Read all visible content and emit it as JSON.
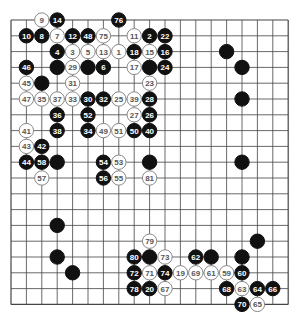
{
  "board": {
    "size": 19,
    "origin": {
      "x": 11,
      "y": 20
    },
    "spacing": {
      "x": 15.4,
      "y": 15.8
    },
    "stone_radius": 7.2,
    "colors": {
      "background": "#ffffff",
      "grid": "#444444",
      "black_stone": "#111111",
      "black_text": "#ffffff",
      "white_stone": "#ffffff",
      "white_stroke": "#888888",
      "white_text": "#555555"
    }
  },
  "stones": [
    {
      "col": 2,
      "row": 0,
      "color": "white",
      "label": "9"
    },
    {
      "col": 3,
      "row": 0,
      "color": "black",
      "label": "14"
    },
    {
      "col": 7,
      "row": 0,
      "color": "black",
      "label": "76"
    },
    {
      "col": 1,
      "row": 1,
      "color": "black",
      "label": "10"
    },
    {
      "col": 2,
      "row": 1,
      "color": "black",
      "label": "8"
    },
    {
      "col": 3,
      "row": 1,
      "color": "white",
      "label": "7"
    },
    {
      "col": 4,
      "row": 1,
      "color": "black",
      "label": "12"
    },
    {
      "col": 5,
      "row": 1,
      "color": "black",
      "label": "48"
    },
    {
      "col": 6,
      "row": 1,
      "color": "white",
      "label": "75"
    },
    {
      "col": 8,
      "row": 1,
      "color": "white",
      "label": "11"
    },
    {
      "col": 9,
      "row": 1,
      "color": "black",
      "label": "2"
    },
    {
      "col": 10,
      "row": 1,
      "color": "black",
      "label": "22"
    },
    {
      "col": 3,
      "row": 2,
      "color": "black",
      "label": "4"
    },
    {
      "col": 4,
      "row": 2,
      "color": "white",
      "label": "3"
    },
    {
      "col": 5,
      "row": 2,
      "color": "white",
      "label": "5"
    },
    {
      "col": 6,
      "row": 2,
      "color": "white",
      "label": "13"
    },
    {
      "col": 7,
      "row": 2,
      "color": "white",
      "label": "1"
    },
    {
      "col": 8,
      "row": 2,
      "color": "black",
      "label": "18"
    },
    {
      "col": 9,
      "row": 2,
      "color": "white",
      "label": "15"
    },
    {
      "col": 10,
      "row": 2,
      "color": "black",
      "label": "16"
    },
    {
      "col": 14,
      "row": 2,
      "color": "black",
      "label": ""
    },
    {
      "col": 1,
      "row": 3,
      "color": "black",
      "label": "46"
    },
    {
      "col": 3,
      "row": 3,
      "color": "black",
      "label": ""
    },
    {
      "col": 4,
      "row": 3,
      "color": "white",
      "label": "29"
    },
    {
      "col": 5,
      "row": 3,
      "color": "black",
      "label": ""
    },
    {
      "col": 6,
      "row": 3,
      "color": "black",
      "label": "6"
    },
    {
      "col": 8,
      "row": 3,
      "color": "white",
      "label": "17"
    },
    {
      "col": 9,
      "row": 3,
      "color": "black",
      "label": ""
    },
    {
      "col": 10,
      "row": 3,
      "color": "black",
      "label": "24"
    },
    {
      "col": 15,
      "row": 3,
      "color": "black",
      "label": ""
    },
    {
      "col": 1,
      "row": 4,
      "color": "white",
      "label": "45"
    },
    {
      "col": 2,
      "row": 4,
      "color": "black",
      "label": ""
    },
    {
      "col": 4,
      "row": 4,
      "color": "white",
      "label": "31"
    },
    {
      "col": 9,
      "row": 4,
      "color": "white",
      "label": "23"
    },
    {
      "col": 1,
      "row": 5,
      "color": "white",
      "label": "47"
    },
    {
      "col": 2,
      "row": 5,
      "color": "white",
      "label": "35"
    },
    {
      "col": 3,
      "row": 5,
      "color": "white",
      "label": "37"
    },
    {
      "col": 4,
      "row": 5,
      "color": "white",
      "label": "33"
    },
    {
      "col": 5,
      "row": 5,
      "color": "black",
      "label": "30"
    },
    {
      "col": 6,
      "row": 5,
      "color": "black",
      "label": "32"
    },
    {
      "col": 7,
      "row": 5,
      "color": "white",
      "label": "25"
    },
    {
      "col": 8,
      "row": 5,
      "color": "white",
      "label": "39"
    },
    {
      "col": 9,
      "row": 5,
      "color": "black",
      "label": "28"
    },
    {
      "col": 15,
      "row": 5,
      "color": "black",
      "label": ""
    },
    {
      "col": 3,
      "row": 6,
      "color": "black",
      "label": "36"
    },
    {
      "col": 5,
      "row": 6,
      "color": "black",
      "label": "52"
    },
    {
      "col": 8,
      "row": 6,
      "color": "white",
      "label": "27"
    },
    {
      "col": 9,
      "row": 6,
      "color": "black",
      "label": "26"
    },
    {
      "col": 1,
      "row": 7,
      "color": "white",
      "label": "41"
    },
    {
      "col": 3,
      "row": 7,
      "color": "black",
      "label": "38"
    },
    {
      "col": 5,
      "row": 7,
      "color": "black",
      "label": "34"
    },
    {
      "col": 6,
      "row": 7,
      "color": "white",
      "label": "49"
    },
    {
      "col": 7,
      "row": 7,
      "color": "white",
      "label": "51"
    },
    {
      "col": 8,
      "row": 7,
      "color": "black",
      "label": "50"
    },
    {
      "col": 9,
      "row": 7,
      "color": "black",
      "label": "40"
    },
    {
      "col": 1,
      "row": 8,
      "color": "white",
      "label": "43"
    },
    {
      "col": 2,
      "row": 8,
      "color": "black",
      "label": "42"
    },
    {
      "col": 1,
      "row": 9,
      "color": "black",
      "label": "44"
    },
    {
      "col": 2,
      "row": 9,
      "color": "black",
      "label": "58"
    },
    {
      "col": 3,
      "row": 9,
      "color": "black",
      "label": ""
    },
    {
      "col": 6,
      "row": 9,
      "color": "black",
      "label": "54"
    },
    {
      "col": 7,
      "row": 9,
      "color": "white",
      "label": "53"
    },
    {
      "col": 9,
      "row": 9,
      "color": "black",
      "label": ""
    },
    {
      "col": 15,
      "row": 9,
      "color": "black",
      "label": ""
    },
    {
      "col": 2,
      "row": 10,
      "color": "white",
      "label": "57"
    },
    {
      "col": 6,
      "row": 10,
      "color": "black",
      "label": "56"
    },
    {
      "col": 7,
      "row": 10,
      "color": "white",
      "label": "55"
    },
    {
      "col": 9,
      "row": 10,
      "color": "white",
      "label": "81"
    },
    {
      "col": 3,
      "row": 13,
      "color": "black",
      "label": ""
    },
    {
      "col": 9,
      "row": 14,
      "color": "white",
      "label": "79"
    },
    {
      "col": 16,
      "row": 14,
      "color": "black",
      "label": ""
    },
    {
      "col": 3,
      "row": 15,
      "color": "black",
      "label": ""
    },
    {
      "col": 8,
      "row": 15,
      "color": "black",
      "label": "80"
    },
    {
      "col": 9,
      "row": 15,
      "color": "black",
      "label": ""
    },
    {
      "col": 10,
      "row": 15,
      "color": "white",
      "label": "73"
    },
    {
      "col": 12,
      "row": 15,
      "color": "black",
      "label": "62"
    },
    {
      "col": 13,
      "row": 15,
      "color": "black",
      "label": ""
    },
    {
      "col": 15,
      "row": 15,
      "color": "black",
      "label": ""
    },
    {
      "col": 4,
      "row": 16,
      "color": "black",
      "label": ""
    },
    {
      "col": 8,
      "row": 16,
      "color": "black",
      "label": "72"
    },
    {
      "col": 9,
      "row": 16,
      "color": "white",
      "label": "71"
    },
    {
      "col": 10,
      "row": 16,
      "color": "black",
      "label": "74"
    },
    {
      "col": 11,
      "row": 16,
      "color": "white",
      "label": "19"
    },
    {
      "col": 12,
      "row": 16,
      "color": "white",
      "label": "69"
    },
    {
      "col": 13,
      "row": 16,
      "color": "white",
      "label": "61"
    },
    {
      "col": 14,
      "row": 16,
      "color": "white",
      "label": "59"
    },
    {
      "col": 15,
      "row": 16,
      "color": "black",
      "label": "60"
    },
    {
      "col": 8,
      "row": 17,
      "color": "black",
      "label": "78"
    },
    {
      "col": 9,
      "row": 17,
      "color": "black",
      "label": "20"
    },
    {
      "col": 10,
      "row": 17,
      "color": "white",
      "label": "67"
    },
    {
      "col": 14,
      "row": 17,
      "color": "black",
      "label": "68"
    },
    {
      "col": 15,
      "row": 17,
      "color": "white",
      "label": "63"
    },
    {
      "col": 16,
      "row": 17,
      "color": "black",
      "label": "64"
    },
    {
      "col": 17,
      "row": 17,
      "color": "black",
      "label": "66"
    },
    {
      "col": 15,
      "row": 18,
      "color": "black",
      "label": "70"
    },
    {
      "col": 16,
      "row": 18,
      "color": "white",
      "label": "65"
    }
  ]
}
